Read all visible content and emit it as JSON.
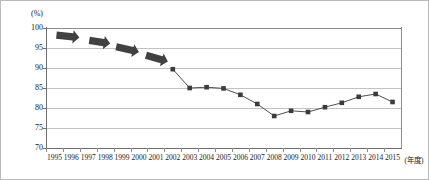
{
  "chart_data": {
    "type": "line",
    "title": "",
    "subtitle": "",
    "xlabel": "(年度)",
    "ylabel": "(%)",
    "ylim": [
      70,
      100
    ],
    "ytick_labels": [
      "100",
      "95",
      "90",
      "85",
      "80",
      "75",
      "70"
    ],
    "ytick_values": [
      100,
      95,
      90,
      85,
      80,
      75,
      70
    ],
    "grid": true,
    "legend": "none",
    "categories": [
      "1995",
      "1996",
      "1997",
      "1998",
      "1999",
      "2000",
      "2001",
      "2002",
      "2003",
      "2004",
      "2005",
      "2006",
      "2007",
      "2008",
      "2009",
      "2010",
      "2011",
      "2012",
      "2013",
      "2014",
      "2015"
    ],
    "series": [
      {
        "name": "",
        "marker": "square",
        "color": "#3b3b3b",
        "x": [
          "2002",
          "2003",
          "2004",
          "2005",
          "2006",
          "2007",
          "2008",
          "2009",
          "2010",
          "2011",
          "2012",
          "2013",
          "2014",
          "2015"
        ],
        "values": [
          89.7,
          85.0,
          85.2,
          84.9,
          83.3,
          81.0,
          78.0,
          79.3,
          79.0,
          80.2,
          81.3,
          82.8,
          83.5,
          81.5
        ]
      }
    ],
    "annotations": [
      {
        "kind": "arrow",
        "label": "arrow-1",
        "span": [
          "1995",
          "1996"
        ],
        "direction": "right-slightly-down"
      },
      {
        "kind": "arrow",
        "label": "arrow-2",
        "span": [
          "1997",
          "1998"
        ],
        "direction": "right-down"
      },
      {
        "kind": "arrow",
        "label": "arrow-3",
        "span": [
          "1999",
          "2000"
        ],
        "direction": "right-down"
      },
      {
        "kind": "arrow",
        "label": "arrow-4",
        "span": [
          "2000",
          "2001"
        ],
        "direction": "right-down"
      }
    ]
  },
  "axes": {
    "unit_label": "(%)",
    "x_unit_label": "(年度)"
  }
}
